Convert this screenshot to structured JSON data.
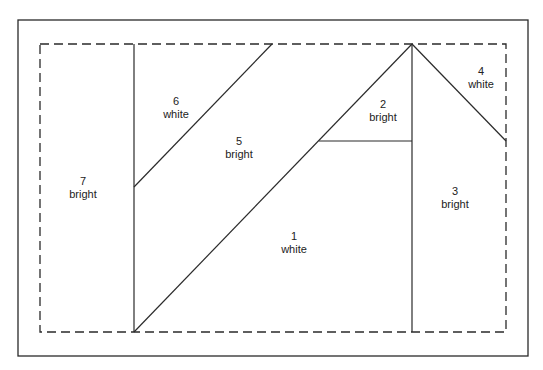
{
  "diagram": {
    "colors": {
      "line": "#2a2a2a",
      "background": "#ffffff"
    },
    "regions": [
      {
        "id": "1",
        "number": "1",
        "label": "white",
        "x": 294,
        "y": 240
      },
      {
        "id": "2",
        "number": "2",
        "label": "bright",
        "x": 383,
        "y": 108
      },
      {
        "id": "3",
        "number": "3",
        "label": "bright",
        "x": 455,
        "y": 195
      },
      {
        "id": "4",
        "number": "4",
        "label": "white",
        "x": 481,
        "y": 75
      },
      {
        "id": "5",
        "number": "5",
        "label": "bright",
        "x": 239,
        "y": 145
      },
      {
        "id": "6",
        "number": "6",
        "label": "white",
        "x": 176,
        "y": 105
      },
      {
        "id": "7",
        "number": "7",
        "label": "bright",
        "x": 83,
        "y": 185
      }
    ]
  }
}
